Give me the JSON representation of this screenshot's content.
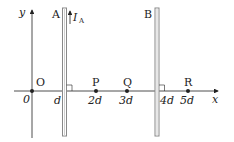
{
  "diagram": {
    "axes": {
      "x_label": "x",
      "y_label": "y",
      "origin_tick": "0"
    },
    "wires": [
      {
        "name": "A",
        "position_label": "d",
        "current_label": "I",
        "current_subscript": "A",
        "current_direction": "up"
      },
      {
        "name": "B",
        "position_label": "4d"
      }
    ],
    "points": [
      {
        "name": "O",
        "position_label": ""
      },
      {
        "name": "P",
        "position_label": "2d"
      },
      {
        "name": "Q",
        "position_label": "3d"
      },
      {
        "name": "R",
        "position_label": "5d"
      }
    ],
    "colors": {
      "line": "#222222",
      "wire": "#888888"
    }
  }
}
